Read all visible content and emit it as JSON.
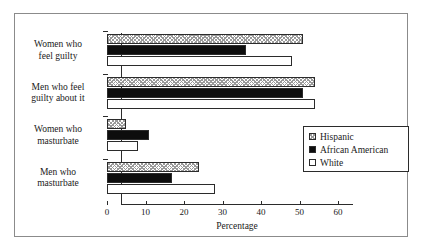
{
  "chart_data": {
    "type": "bar",
    "orientation": "horizontal",
    "title": "",
    "xlabel": "Percentage",
    "ylabel": "",
    "xlim": [
      0,
      60
    ],
    "xticks": [
      0,
      10,
      20,
      30,
      40,
      50,
      60
    ],
    "xtick_labels": [
      "0",
      "10",
      "20",
      "30",
      "40",
      "50",
      "60"
    ],
    "grid": false,
    "legend_position": "center-right",
    "categories": [
      "Women who feel guilty",
      "Men who feel guilty about it",
      "Women who masturbate",
      "Men who masturbate"
    ],
    "category_lines": [
      [
        "Women who",
        "feel guilty"
      ],
      [
        "Men who feel",
        "guilty about it"
      ],
      [
        "Women who",
        "masturbate"
      ],
      [
        "Men who",
        "masturbate"
      ]
    ],
    "series": [
      {
        "name": "Hispanic",
        "fill": "hatched",
        "values": [
          51,
          54,
          5,
          24
        ]
      },
      {
        "name": "African American",
        "fill": "solid-black",
        "values": [
          36,
          51,
          11,
          17
        ]
      },
      {
        "name": "White",
        "fill": "empty",
        "values": [
          48,
          54,
          8,
          28
        ]
      }
    ]
  },
  "colors": {
    "axis": "#2b2b2b",
    "frame": "#8b8b8b",
    "african_american": "#0d0d0d",
    "hatch": "#9a9a9a",
    "background": "#ffffff"
  }
}
